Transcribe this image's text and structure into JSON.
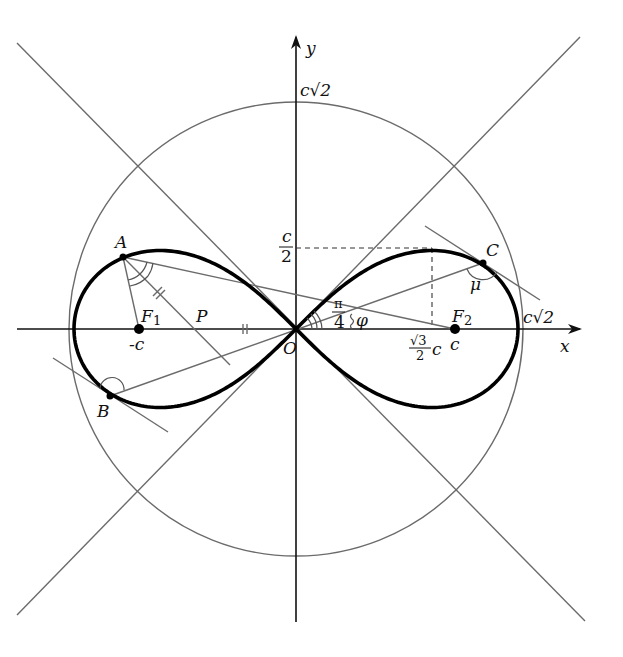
{
  "figure": {
    "axes": {
      "x_label": "x",
      "y_label": "y",
      "origin_label": "O"
    },
    "labels": {
      "y_top": "c√2",
      "x_right": "c√2",
      "half_c_num": "c",
      "half_c_den": "2",
      "sqrt3_num": "√3",
      "sqrt3_den": "2",
      "sqrt3_c": "c",
      "pi_num": "π",
      "pi_den": "4",
      "phi": "φ",
      "mu": "μ",
      "point_A": "A",
      "point_B": "B",
      "point_C": "C",
      "point_P": "P",
      "focus_F1": "F",
      "focus_F1_sub": "1",
      "focus_F2": "F",
      "focus_F2_sub": "2",
      "minus_c": "-c",
      "plus_c": "c"
    },
    "colors": {
      "curve": "#000000",
      "lines": "#6b6b6b",
      "axes": "#111111"
    }
  }
}
